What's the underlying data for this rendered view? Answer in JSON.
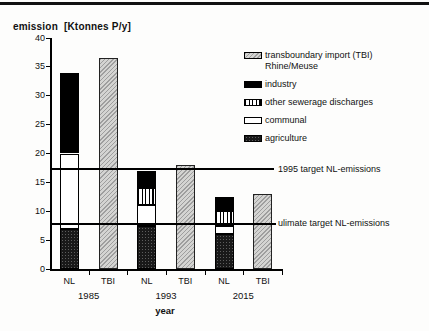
{
  "page": {
    "top_rule_color": "#111111",
    "background_color": "#fdfdfc"
  },
  "chart_data": {
    "type": "bar",
    "stacked": true,
    "title": "emission  [Ktonnes P/y]",
    "ylabel": "emission [Ktonnes P/y]",
    "xlabel": "year",
    "ylim": [
      0,
      40
    ],
    "ytick_step": 5,
    "grid": false,
    "legend_position": "right",
    "categories": [
      "NL 1985",
      "TBI 1985",
      "NL 1993",
      "TBI 1993",
      "NL 2015",
      "TBI 2015"
    ],
    "x_axis": {
      "label": "year",
      "groups": [
        {
          "year": "1985",
          "columns": [
            "NL",
            "TBI"
          ]
        },
        {
          "year": "1993",
          "columns": [
            "NL",
            "TBI"
          ]
        },
        {
          "year": "2015",
          "columns": [
            "NL",
            "TBI"
          ]
        }
      ]
    },
    "series": [
      {
        "name": "agriculture",
        "pattern": "dark-dots",
        "color": "#191919",
        "values": [
          7,
          0,
          7.5,
          0,
          6,
          0
        ]
      },
      {
        "name": "communal",
        "pattern": "white",
        "color": "#ffffff",
        "values": [
          13,
          0,
          3.5,
          0,
          1.5,
          0
        ]
      },
      {
        "name": "other sewerage discharges",
        "pattern": "vertical-stripes",
        "color": "#000000",
        "values": [
          0,
          0,
          3,
          0,
          2.5,
          0
        ]
      },
      {
        "name": "industry",
        "pattern": "solid-black",
        "color": "#000000",
        "values": [
          14,
          0,
          3,
          0,
          2.5,
          0
        ]
      },
      {
        "name": "transboundary import (TBI) Rhine/Meuse",
        "pattern": "gray-hatch",
        "color": "#c8c8c6",
        "values": [
          0,
          36.5,
          0,
          18,
          0,
          13
        ]
      }
    ],
    "reference_lines": [
      {
        "label": "1995 target NL-emissions",
        "value": 17.3
      },
      {
        "label": "ulimate target NL-emissions",
        "value": 7.8
      }
    ],
    "legend": [
      {
        "label": "transboundary import (TBI)",
        "sublabel": "Rhine/Meuse",
        "pattern": "gray-hatch"
      },
      {
        "label": "industry",
        "sublabel": "",
        "pattern": "solid-black"
      },
      {
        "label": "other sewerage discharges",
        "sublabel": "",
        "pattern": "vertical-stripes"
      },
      {
        "label": "communal",
        "sublabel": "",
        "pattern": "white"
      },
      {
        "label": "agriculture",
        "sublabel": "",
        "pattern": "dark-dots"
      }
    ]
  }
}
